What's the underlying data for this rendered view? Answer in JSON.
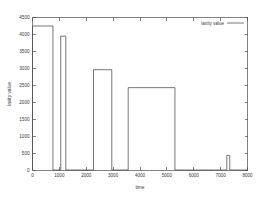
{
  "chart_data": {
    "type": "bar",
    "title": "",
    "xlabel": "time",
    "ylabel": "laxity value",
    "xlim": [
      0,
      8000
    ],
    "ylim": [
      0,
      4500
    ],
    "grid": false,
    "legend_position": "top-right",
    "legend": [
      {
        "name": "laxity value",
        "marker": "line",
        "color": "#4a4a4a"
      }
    ],
    "xticks": [
      0,
      1000,
      2000,
      3000,
      4000,
      5000,
      6000,
      7000,
      8000
    ],
    "xtick_labels": [
      "0",
      "1000",
      "2000",
      "3000",
      "4000",
      "5000",
      "6000",
      "7000",
      "8000"
    ],
    "yticks": [
      0,
      500,
      1000,
      1500,
      2000,
      2500,
      3000,
      3500,
      4000,
      4500
    ],
    "ytick_labels": [
      "0",
      "500",
      "1000",
      "1500",
      "2000",
      "2500",
      "3000",
      "3500",
      "4000",
      "4500"
    ],
    "bars": [
      {
        "label": "bar-1",
        "x_start": 0,
        "x_end": 760,
        "value": 4250
      },
      {
        "label": "bar-2",
        "x_start": 1050,
        "x_end": 1240,
        "value": 3950
      },
      {
        "label": "bar-3",
        "x_start": 2270,
        "x_end": 2950,
        "value": 2960
      },
      {
        "label": "bar-4",
        "x_start": 3560,
        "x_end": 5300,
        "value": 2430
      },
      {
        "label": "bar-5",
        "x_start": 7230,
        "x_end": 7340,
        "value": 430
      }
    ],
    "series": [
      {
        "name": "laxity value",
        "categories": [
          "0-760",
          "1050-1240",
          "2270-2950",
          "3560-5300",
          "7230-7340"
        ],
        "values": [
          4250,
          3950,
          2960,
          2430,
          430
        ]
      }
    ]
  }
}
